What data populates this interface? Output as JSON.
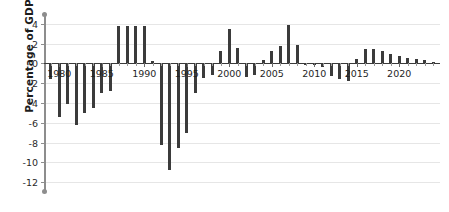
{
  "chart_data": {
    "type": "bar",
    "title": "",
    "xlabel": "",
    "ylabel": "Percentage of GDP",
    "ylim": [
      -13,
      5
    ],
    "xlim": [
      1978.2,
      2024.8
    ],
    "grid": true,
    "legend": false,
    "yticks": [
      4,
      2,
      0,
      -2,
      -4,
      -6,
      -8,
      -10,
      -12
    ],
    "ytick_labels": [
      "4",
      "2",
      "0",
      "-2",
      "-4",
      "-6",
      "-8",
      "-10",
      "-12"
    ],
    "xticks": [
      1980,
      1985,
      1990,
      1995,
      2000,
      2005,
      2010,
      2015,
      2020
    ],
    "xtick_labels": [
      "1980",
      "1985",
      "1990",
      "1995",
      "2000",
      "2005",
      "2010",
      "2015",
      "2020"
    ],
    "bar_color": "#3b3b3b",
    "axis_color": "#8d8d8d",
    "grid_color": "#e6e6e6",
    "categories": [
      1979,
      1980,
      1981,
      1982,
      1983,
      1984,
      1985,
      1986,
      1987,
      1988,
      1989,
      1990,
      1991,
      1992,
      1993,
      1994,
      1995,
      1996,
      1997,
      1998,
      1999,
      2000,
      2001,
      2002,
      2003,
      2004,
      2005,
      2006,
      2007,
      2008,
      2009,
      2010,
      2011,
      2012,
      2013,
      2014,
      2015,
      2016,
      2017,
      2018,
      2019,
      2020,
      2021,
      2022,
      2023,
      2024
    ],
    "values": [
      -1.6,
      -5.4,
      -4.1,
      -6.2,
      -5.0,
      -4.5,
      -3.0,
      -2.8,
      3.8,
      3.8,
      3.8,
      3.8,
      0.2,
      -8.2,
      -10.8,
      -8.6,
      -7.0,
      -3.0,
      -1.5,
      -1.2,
      1.3,
      3.5,
      1.6,
      -1.4,
      -1.2,
      0.3,
      1.3,
      1.8,
      3.9,
      1.9,
      -0.2,
      -0.2,
      -0.4,
      -1.3,
      -1.6,
      -1.8,
      0.4,
      1.5,
      1.5,
      1.3,
      1.0,
      0.8,
      0.6,
      0.5,
      0.3,
      0.1
    ]
  }
}
